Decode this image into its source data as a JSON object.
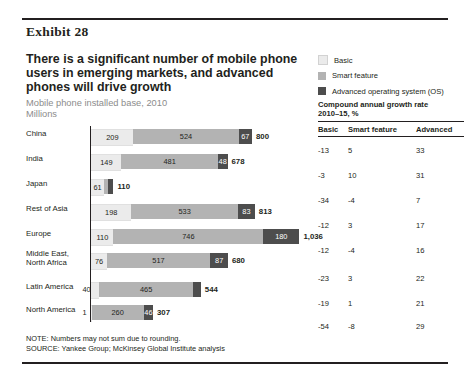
{
  "exhibit_label": "Exhibit 28",
  "headline": "There is a significant number of mobile phone users in emerging markets, and advanced phones will drive growth",
  "subtitle_line1": "Mobile phone installed base, 2010",
  "subtitle_line2": "Millions",
  "legend": {
    "items": [
      {
        "label": "Basic",
        "color": "#ebebeb",
        "icon": "legend-swatch-icon"
      },
      {
        "label": "Smart feature",
        "color": "#b3b3b3",
        "icon": "legend-swatch-icon"
      },
      {
        "label": "Advanced operating system (OS)",
        "color": "#4d4d4d",
        "icon": "legend-swatch-icon"
      }
    ]
  },
  "cagr": {
    "title_line1": "Compound annual growth rate",
    "title_line2": "2010–15, %",
    "headers": [
      "Basic",
      "Smart feature",
      "Advanced"
    ],
    "rows": [
      [
        "-13",
        "5",
        "33"
      ],
      [
        "-3",
        "10",
        "31"
      ],
      [
        "-34",
        "-4",
        "7"
      ],
      [
        "-12",
        "3",
        "17"
      ],
      [
        "-12",
        "-4",
        "16"
      ],
      [
        "-23",
        "3",
        "22"
      ],
      [
        "-19",
        "1",
        "21"
      ],
      [
        "-54",
        "-8",
        "29"
      ]
    ]
  },
  "notes": {
    "note": "NOTE: Numbers may not sum due to rounding.",
    "source": "SOURCE: Yankee Group; McKinsey Global Institute analysis"
  },
  "chart_data": {
    "type": "bar",
    "orientation": "horizontal",
    "stacked": true,
    "title": "Mobile phone installed base, 2010",
    "ylabel": "",
    "xlabel": "Millions",
    "grid": false,
    "legend_position": "top-right",
    "categories": [
      "China",
      "India",
      "Japan",
      "Rest of Asia",
      "Europe",
      "Middle East, North Africa",
      "Latin America",
      "North America"
    ],
    "series": [
      {
        "name": "Basic",
        "color": "#ebebeb",
        "values": [
          209,
          149,
          61,
          198,
          110,
          76,
          40,
          1
        ]
      },
      {
        "name": "Smart feature",
        "color": "#b3b3b3",
        "values": [
          524,
          481,
          24,
          533,
          746,
          517,
          465,
          260
        ]
      },
      {
        "name": "Advanced operating system (OS)",
        "color": "#4d4d4d",
        "values": [
          67,
          48,
          25,
          83,
          180,
          87,
          40,
          46
        ]
      }
    ],
    "totals": [
      800,
      678,
      110,
      813,
      1036,
      680,
      544,
      307
    ],
    "total_labels": [
      "800",
      "678",
      "110",
      "813",
      "1,036",
      "680",
      "544",
      "307"
    ],
    "segment_labels": [
      {
        "basic": "209",
        "smart": "524",
        "advanced": "67"
      },
      {
        "basic": "149",
        "smart": "481",
        "advanced": "48"
      },
      {
        "basic": "61",
        "smart": "24",
        "advanced": "25"
      },
      {
        "basic": "198",
        "smart": "533",
        "advanced": "83"
      },
      {
        "basic": "110",
        "smart": "746",
        "advanced": "180"
      },
      {
        "basic": "76",
        "smart": "517",
        "advanced": "87"
      },
      {
        "basic": "40",
        "smart": "465",
        "advanced": "40"
      },
      {
        "basic": "1",
        "smart": "260",
        "advanced": "46"
      }
    ],
    "xlim": [
      0,
      1036
    ],
    "value_unit": "millions"
  }
}
